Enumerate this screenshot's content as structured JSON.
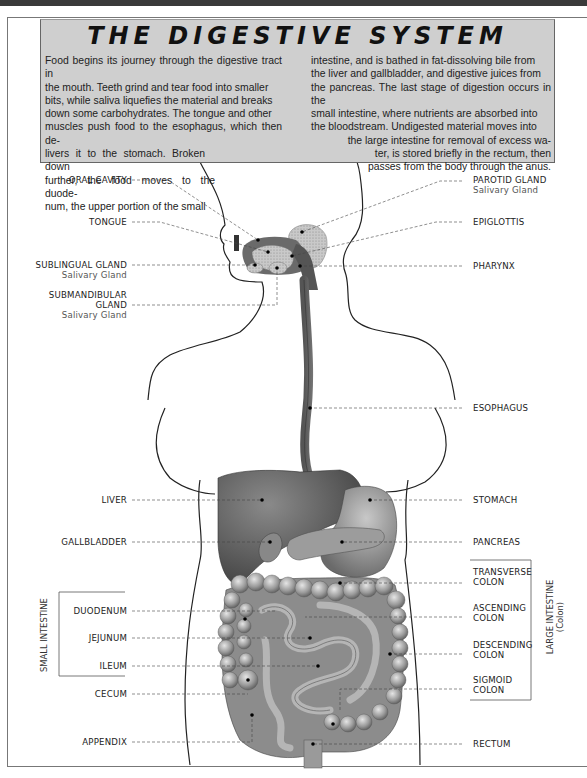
{
  "title": "THE DIGESTIVE SYSTEM",
  "intro": {
    "left_lines": [
      "Food begins its journey through the digestive tract in",
      "the mouth. Teeth grind and tear food into smaller",
      "bits, while saliva liquefies the material and breaks",
      "down some carbohydrates. The tongue and other",
      "muscles push food to the esophagus, which then de-",
      "livers it to the stomach. Broken down",
      "further, the food moves to the duode-",
      "num, the upper portion of the small"
    ],
    "right_lines": [
      "intestine, and is bathed in fat-dissolving bile from",
      "the liver and gallbladder, and digestive juices from",
      "the pancreas. The last stage of digestion occurs in the",
      "small intestine, where nutrients are absorbed into",
      "the bloodstream. Undigested material moves into",
      "the large intestine for removal of excess wa-",
      "ter, is stored briefly in the rectum, then",
      "passes from the body through the anus."
    ]
  },
  "labels_left": [
    {
      "name": "ORAL CAVITY",
      "sub": ""
    },
    {
      "name": "TONGUE",
      "sub": ""
    },
    {
      "name": "SUBLINGUAL GLAND",
      "sub": "Salivary Gland"
    },
    {
      "name": "SUBMANDIBULAR",
      "name2": "GLAND",
      "sub": "Salivary Gland"
    },
    {
      "name": "LIVER",
      "sub": ""
    },
    {
      "name": "GALLBLADDER",
      "sub": ""
    },
    {
      "name": "DUODENUM",
      "sub": ""
    },
    {
      "name": "JEJUNUM",
      "sub": ""
    },
    {
      "name": "ILEUM",
      "sub": ""
    },
    {
      "name": "CECUM",
      "sub": ""
    },
    {
      "name": "APPENDIX",
      "sub": ""
    }
  ],
  "labels_right": [
    {
      "name": "PAROTID GLAND",
      "sub": "Salivary Gland"
    },
    {
      "name": "EPIGLOTTIS",
      "sub": ""
    },
    {
      "name": "PHARYNX",
      "sub": ""
    },
    {
      "name": "ESOPHAGUS",
      "sub": ""
    },
    {
      "name": "STOMACH",
      "sub": ""
    },
    {
      "name": "PANCREAS",
      "sub": ""
    },
    {
      "name": "TRANSVERSE",
      "name2": "COLON"
    },
    {
      "name": "ASCENDING",
      "name2": "COLON"
    },
    {
      "name": "DESCENDING",
      "name2": "COLON"
    },
    {
      "name": "SIGMOID",
      "name2": "COLON"
    },
    {
      "name": "RECTUM",
      "sub": ""
    }
  ],
  "groups": {
    "small_intestine": "SMALL INTESTINE",
    "large_intestine": "LARGE INTESTINE",
    "large_intestine_sub": "(Colon)"
  }
}
